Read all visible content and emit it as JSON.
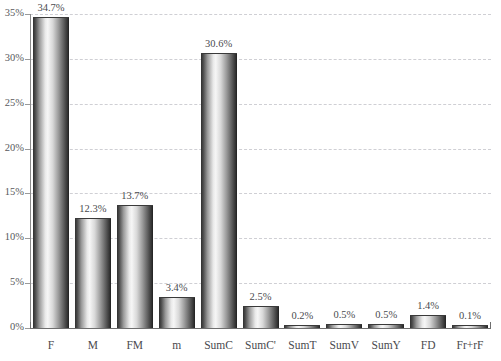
{
  "chart_data": {
    "type": "bar",
    "title": "",
    "xlabel": "",
    "ylabel": "",
    "ylim": [
      0,
      35
    ],
    "grid": true,
    "legend": "none",
    "yticks": [
      "0%",
      "5%",
      "10%",
      "15%",
      "20%",
      "25%",
      "30%",
      "35%"
    ],
    "ytick_values": [
      0,
      5,
      10,
      15,
      20,
      25,
      30,
      35
    ],
    "categories": [
      "F",
      "M",
      "FM",
      "m",
      "SumC",
      "SumC'",
      "SumT",
      "SumV",
      "SumY",
      "FD",
      "Fr+rF"
    ],
    "values": [
      34.7,
      12.3,
      13.7,
      3.4,
      30.6,
      2.5,
      0.2,
      0.5,
      0.5,
      1.4,
      0.1
    ],
    "value_labels": [
      "34.7%",
      "12.3%",
      "13.7%",
      "3.4%",
      "30.6%",
      "2.5%",
      "0.2%",
      "0.5%",
      "0.5%",
      "1.4%",
      "0.1%"
    ]
  },
  "colors": {
    "background": "#ffffff",
    "gridline": "#cfcfd4",
    "axis": "#6e6e6e",
    "text": "#4a4a4e",
    "bar_dark": "#2f2f2f",
    "bar_light": "#f6f6f6"
  }
}
